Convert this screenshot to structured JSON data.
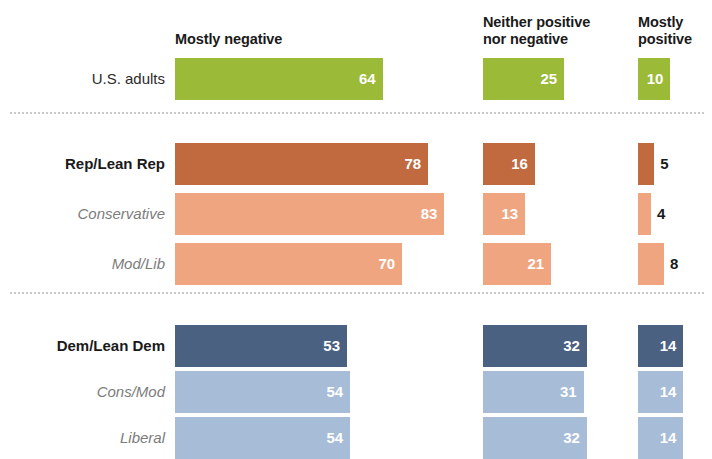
{
  "headers": {
    "negative": "Mostly negative",
    "neutral": "Neither positive\nnor negative",
    "neutral_line1": "Neither positive",
    "neutral_line2": "nor negative",
    "positive": "Mostly\npositive",
    "positive_line1": "Mostly",
    "positive_line2": "positive"
  },
  "colors": {
    "green": "#9aba38",
    "orange_dark": "#c1693f",
    "orange_light": "#f0a581",
    "blue_dark": "#4a6182",
    "blue_light": "#a7bcd6",
    "divider": "#c9c9c9",
    "label_sub": "#7c7c7c",
    "label_head": "#1a1a1a"
  },
  "rows": [
    {
      "label": "U.S. adults",
      "style": "plain",
      "color": "#9aba38",
      "negative": 64,
      "neutral": 25,
      "positive": 10,
      "negative_text": "64",
      "neutral_text": "25",
      "positive_text": "10"
    },
    {
      "label": "Rep/Lean Rep",
      "style": "head",
      "color": "#c1693f",
      "negative": 78,
      "neutral": 16,
      "positive": 5,
      "negative_text": "78",
      "neutral_text": "16",
      "positive_text": "5"
    },
    {
      "label": "Conservative",
      "style": "sub",
      "color": "#f0a581",
      "negative": 83,
      "neutral": 13,
      "positive": 4,
      "negative_text": "83",
      "neutral_text": "13",
      "positive_text": "4"
    },
    {
      "label": "Mod/Lib",
      "style": "sub",
      "color": "#f0a581",
      "negative": 70,
      "neutral": 21,
      "positive": 8,
      "negative_text": "70",
      "neutral_text": "21",
      "positive_text": "8"
    },
    {
      "label": "Dem/Lean Dem",
      "style": "head",
      "color": "#4a6182",
      "negative": 53,
      "neutral": 32,
      "positive": 14,
      "negative_text": "53",
      "neutral_text": "32",
      "positive_text": "14"
    },
    {
      "label": "Cons/Mod",
      "style": "sub",
      "color": "#a7bcd6",
      "negative": 54,
      "neutral": 31,
      "positive": 14,
      "negative_text": "54",
      "neutral_text": "31",
      "positive_text": "14"
    },
    {
      "label": "Liberal",
      "style": "sub",
      "color": "#a7bcd6",
      "negative": 54,
      "neutral": 32,
      "positive": 14,
      "negative_text": "54",
      "neutral_text": "32",
      "positive_text": "14"
    }
  ],
  "chart_data": {
    "type": "bar",
    "orientation": "horizontal",
    "title": "",
    "subtitle": "",
    "xlabel": "",
    "ylabel": "",
    "grid": false,
    "legend_position": "top",
    "units": "percent",
    "categories": [
      "U.S. adults",
      "Rep/Lean Rep",
      "Conservative",
      "Mod/Lib",
      "Dem/Lean Dem",
      "Cons/Mod",
      "Liberal"
    ],
    "series": [
      {
        "name": "Mostly negative",
        "values": [
          64,
          78,
          83,
          70,
          53,
          54,
          54
        ]
      },
      {
        "name": "Neither positive nor negative",
        "values": [
          25,
          16,
          13,
          21,
          32,
          31,
          32
        ]
      },
      {
        "name": "Mostly positive",
        "values": [
          10,
          5,
          4,
          8,
          14,
          14,
          14
        ]
      }
    ],
    "group_dividers_after": [
      "U.S. adults",
      "Mod/Lib"
    ],
    "xlim": [
      0,
      100
    ],
    "series_colors_by_group": {
      "U.S. adults": "#9aba38",
      "Rep/Lean Rep": "#c1693f",
      "Conservative": "#f0a581",
      "Mod/Lib": "#f0a581",
      "Dem/Lean Dem": "#4a6182",
      "Cons/Mod": "#a7bcd6",
      "Liberal": "#a7bcd6"
    }
  }
}
